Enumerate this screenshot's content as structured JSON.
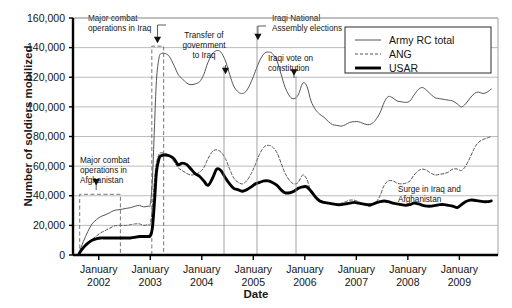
{
  "chart_data": {
    "type": "line",
    "title": "",
    "xlabel": "Date",
    "ylabel": "Number of soldiers mobilized",
    "ylim": [
      0,
      160000
    ],
    "yticks": [
      "0",
      "20,000",
      "40,000",
      "60,000",
      "80,000",
      "100,000",
      "120,000",
      "140,000",
      "160,000"
    ],
    "ytick_values": [
      0,
      20000,
      40000,
      60000,
      80000,
      100000,
      120000,
      140000,
      160000
    ],
    "xlim": [
      2001.5,
      2009.75
    ],
    "xticks": [
      2002,
      2003,
      2004,
      2005,
      2006,
      2007,
      2008,
      2009
    ],
    "xtick_labels": [
      {
        "month": "January",
        "year": "2002"
      },
      {
        "month": "January",
        "year": "2003"
      },
      {
        "month": "January",
        "year": "2004"
      },
      {
        "month": "January",
        "year": "2005"
      },
      {
        "month": "January",
        "year": "2006"
      },
      {
        "month": "January",
        "year": "2007"
      },
      {
        "month": "January",
        "year": "2008"
      },
      {
        "month": "January",
        "year": "2009"
      }
    ],
    "grid": "horizontal",
    "legend_position": "top-right",
    "series": [
      {
        "name": "Army RC total",
        "style": "solid-thin",
        "color": "#555555",
        "x": [
          2001.62,
          2001.7,
          2001.79,
          2001.87,
          2001.96,
          2002.04,
          2002.12,
          2002.21,
          2002.29,
          2002.37,
          2002.46,
          2002.54,
          2002.62,
          2002.71,
          2002.79,
          2002.87,
          2002.96,
          2003.0,
          2003.04,
          2003.08,
          2003.12,
          2003.17,
          2003.21,
          2003.29,
          2003.37,
          2003.46,
          2003.54,
          2003.62,
          2003.71,
          2003.79,
          2003.87,
          2003.96,
          2004.04,
          2004.12,
          2004.21,
          2004.29,
          2004.37,
          2004.46,
          2004.54,
          2004.62,
          2004.71,
          2004.79,
          2004.87,
          2004.96,
          2005.04,
          2005.12,
          2005.21,
          2005.29,
          2005.37,
          2005.46,
          2005.54,
          2005.62,
          2005.71,
          2005.79,
          2005.87,
          2005.96,
          2006.04,
          2006.12,
          2006.21,
          2006.29,
          2006.37,
          2006.46,
          2006.54,
          2006.62,
          2006.71,
          2006.79,
          2006.87,
          2006.96,
          2007.04,
          2007.12,
          2007.21,
          2007.29,
          2007.37,
          2007.46,
          2007.54,
          2007.62,
          2007.71,
          2007.79,
          2007.87,
          2007.96,
          2008.04,
          2008.12,
          2008.21,
          2008.29,
          2008.37,
          2008.46,
          2008.54,
          2008.62,
          2008.71,
          2008.79,
          2008.87,
          2008.96,
          2009.04,
          2009.12,
          2009.21,
          2009.29,
          2009.37,
          2009.46,
          2009.54,
          2009.62
        ],
        "y": [
          2000,
          9000,
          16000,
          21000,
          24000,
          26000,
          27000,
          28500,
          30000,
          30500,
          31000,
          31500,
          32000,
          33000,
          33500,
          32500,
          33000,
          34000,
          50000,
          85000,
          118000,
          133000,
          136000,
          136000,
          134000,
          128000,
          122000,
          119000,
          116000,
          115000,
          115500,
          117000,
          122000,
          130000,
          136000,
          138000,
          137000,
          131000,
          122000,
          114000,
          110000,
          109000,
          111000,
          117000,
          124000,
          131000,
          136000,
          137000,
          136000,
          131000,
          122000,
          113000,
          107000,
          105500,
          108000,
          116000,
          114000,
          104000,
          98000,
          95000,
          93000,
          90000,
          88000,
          87500,
          87000,
          88000,
          89500,
          90000,
          90000,
          89000,
          88000,
          88500,
          91000,
          96000,
          103000,
          107000,
          106000,
          104000,
          103500,
          103000,
          104000,
          108000,
          112000,
          113000,
          111000,
          108000,
          106000,
          105500,
          105000,
          104500,
          104000,
          102000,
          100000,
          102000,
          106000,
          109000,
          110000,
          109000,
          110000,
          112000
        ]
      },
      {
        "name": "ANG",
        "style": "dashed-thin",
        "color": "#555555",
        "x": [
          2001.62,
          2001.7,
          2001.79,
          2001.87,
          2001.96,
          2002.04,
          2002.12,
          2002.21,
          2002.29,
          2002.37,
          2002.46,
          2002.54,
          2002.62,
          2002.71,
          2002.79,
          2002.87,
          2002.96,
          2003.0,
          2003.04,
          2003.08,
          2003.12,
          2003.17,
          2003.21,
          2003.29,
          2003.37,
          2003.46,
          2003.54,
          2003.62,
          2003.71,
          2003.79,
          2003.87,
          2003.96,
          2004.04,
          2004.12,
          2004.21,
          2004.29,
          2004.37,
          2004.46,
          2004.54,
          2004.62,
          2004.71,
          2004.79,
          2004.87,
          2004.96,
          2005.04,
          2005.12,
          2005.21,
          2005.29,
          2005.37,
          2005.46,
          2005.54,
          2005.62,
          2005.71,
          2005.79,
          2005.87,
          2005.96,
          2006.04,
          2006.12,
          2006.21,
          2006.29,
          2006.37,
          2006.46,
          2006.54,
          2006.62,
          2006.71,
          2006.79,
          2006.87,
          2006.96,
          2007.04,
          2007.12,
          2007.21,
          2007.29,
          2007.37,
          2007.46,
          2007.54,
          2007.62,
          2007.71,
          2007.79,
          2007.87,
          2007.96,
          2008.04,
          2008.12,
          2008.21,
          2008.29,
          2008.37,
          2008.46,
          2008.54,
          2008.62,
          2008.71,
          2008.79,
          2008.87,
          2008.96,
          2009.04,
          2009.12,
          2009.21,
          2009.29,
          2009.37,
          2009.46,
          2009.54,
          2009.62
        ],
        "y": [
          1000,
          4000,
          7500,
          10500,
          13000,
          15000,
          16500,
          18000,
          19500,
          20000,
          20000,
          20000,
          20500,
          21000,
          21000,
          20000,
          20500,
          21000,
          32000,
          50000,
          62000,
          68000,
          69000,
          68500,
          67000,
          63000,
          59000,
          57000,
          55000,
          54000,
          54500,
          56000,
          59000,
          65000,
          70000,
          71000,
          69500,
          65000,
          58000,
          52000,
          49000,
          48000,
          50000,
          55000,
          61000,
          68000,
          73000,
          74000,
          73000,
          69000,
          62000,
          55000,
          50000,
          48000,
          49000,
          54000,
          51000,
          43000,
          39000,
          37000,
          36000,
          35000,
          34000,
          34500,
          35000,
          36000,
          37000,
          37000,
          36000,
          34500,
          33000,
          33000,
          35000,
          40000,
          47000,
          50000,
          50000,
          48500,
          48000,
          48500,
          50000,
          54000,
          57000,
          58000,
          57000,
          55000,
          54000,
          54500,
          55000,
          56000,
          58000,
          58000,
          57000,
          60000,
          66000,
          72000,
          76000,
          78000,
          79000,
          80000
        ]
      },
      {
        "name": "USAR",
        "style": "solid-thick",
        "color": "#000000",
        "x": [
          2001.62,
          2001.7,
          2001.79,
          2001.87,
          2001.96,
          2002.04,
          2002.12,
          2002.21,
          2002.29,
          2002.37,
          2002.46,
          2002.54,
          2002.62,
          2002.71,
          2002.79,
          2002.87,
          2002.96,
          2003.0,
          2003.04,
          2003.08,
          2003.12,
          2003.17,
          2003.21,
          2003.29,
          2003.37,
          2003.46,
          2003.54,
          2003.62,
          2003.71,
          2003.79,
          2003.87,
          2003.96,
          2004.04,
          2004.12,
          2004.21,
          2004.29,
          2004.37,
          2004.46,
          2004.54,
          2004.62,
          2004.71,
          2004.79,
          2004.87,
          2004.96,
          2005.04,
          2005.12,
          2005.21,
          2005.29,
          2005.37,
          2005.46,
          2005.54,
          2005.62,
          2005.71,
          2005.79,
          2005.87,
          2005.96,
          2006.04,
          2006.12,
          2006.21,
          2006.29,
          2006.37,
          2006.46,
          2006.54,
          2006.62,
          2006.71,
          2006.79,
          2006.87,
          2006.96,
          2007.04,
          2007.12,
          2007.21,
          2007.29,
          2007.37,
          2007.46,
          2007.54,
          2007.62,
          2007.71,
          2007.79,
          2007.87,
          2007.96,
          2008.04,
          2008.12,
          2008.21,
          2008.29,
          2008.37,
          2008.46,
          2008.54,
          2008.62,
          2008.71,
          2008.79,
          2008.87,
          2008.96,
          2009.04,
          2009.12,
          2009.21,
          2009.29,
          2009.37,
          2009.46,
          2009.54,
          2009.62
        ],
        "y": [
          1000,
          5000,
          8000,
          10000,
          11000,
          11500,
          11500,
          11500,
          11500,
          11500,
          11500,
          11500,
          11500,
          12000,
          12500,
          12500,
          12500,
          13000,
          18000,
          35000,
          56000,
          65000,
          67000,
          67500,
          67000,
          65000,
          61000,
          62000,
          61000,
          58000,
          55000,
          53000,
          50000,
          47000,
          52000,
          58000,
          57000,
          52000,
          48000,
          45000,
          44000,
          43000,
          44000,
          46000,
          48000,
          49000,
          50000,
          50000,
          49000,
          47000,
          44000,
          42000,
          42000,
          43000,
          45000,
          46000,
          46000,
          43000,
          39000,
          36500,
          35500,
          35000,
          34500,
          34000,
          34000,
          34500,
          35000,
          35500,
          35000,
          34500,
          34000,
          34000,
          35000,
          36000,
          36500,
          36000,
          35000,
          34500,
          34000,
          33500,
          34000,
          35000,
          34500,
          33500,
          33000,
          33000,
          33500,
          34000,
          34000,
          33500,
          33000,
          32000,
          34000,
          36000,
          37000,
          37000,
          36500,
          36000,
          36000,
          36500
        ]
      }
    ],
    "annotations": [
      {
        "id": "major-combat-iraq",
        "lines": [
          "Major combat",
          "operations in Iraq"
        ],
        "arrow_x": 2003.14,
        "arrow_y_value": 143000
      },
      {
        "id": "major-combat-afghanistan",
        "lines": [
          "Major combat",
          "operations in",
          "Afghanistan"
        ],
        "arrow_x": 2001.95,
        "arrow_y_value": 47000
      },
      {
        "id": "transfer-of-government",
        "lines": [
          "Transfer of",
          "government",
          "to Iraq"
        ],
        "arrow_x": 2004.46,
        "arrow_y_value": 122000
      },
      {
        "id": "iraqi-national-assembly-elections",
        "lines": [
          "Iraqi National",
          "Assembly elections"
        ],
        "arrow_x": 2005.09,
        "arrow_y_value": 145000
      },
      {
        "id": "iraqi-vote-on-constitution",
        "lines": [
          "Iraqi vote on",
          "constitution"
        ],
        "arrow_x": 2005.79,
        "arrow_y_value": 121000
      },
      {
        "id": "surge-in-iraq-and-afghanistan",
        "lines": [
          "Surge in Iraq and",
          "Afghanistan"
        ],
        "arrow_x": null,
        "arrow_y_value": null
      }
    ],
    "highlight_boxes": [
      {
        "id": "iraq-combat-box",
        "x0": 2003.03,
        "x1": 2003.26,
        "y_top": 141000,
        "y_bottom": 0
      },
      {
        "id": "afghanistan-combat-box",
        "x0": 2001.63,
        "x1": 2002.42,
        "y_top": 41000,
        "y_bottom": 0
      }
    ]
  },
  "legend": {
    "items": [
      {
        "label": "Army RC total",
        "style": "solid-thin"
      },
      {
        "label": "ANG",
        "style": "dashed-thin"
      },
      {
        "label": "USAR",
        "style": "solid-thick"
      }
    ]
  },
  "colors": {
    "axis": "#000000",
    "grid": "#b4b4b4",
    "thin_line": "#555555",
    "thick_line": "#000000",
    "text": "#141414",
    "background": "#ffffff"
  }
}
